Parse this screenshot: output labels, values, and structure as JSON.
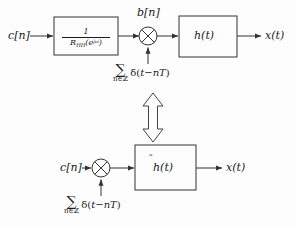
{
  "figure": {
    "background_color": "#fdfdfd",
    "line_color": "#333333",
    "text_color": "#1a1a1a"
  },
  "top_diagram": {
    "input_label": "c[n]",
    "prefilter_block": {
      "numerator": "1",
      "denominator_base": "R",
      "denominator_sub": "HH",
      "denominator_arg_open": "(e",
      "denominator_arg_sup": "jω",
      "denominator_arg_close": ")"
    },
    "intermediate_label": "b[n]",
    "multiplier_symbol": "×",
    "impulse_train": {
      "operator": "∑",
      "limit": "n∈ℤ",
      "body_open": "δ(",
      "body": "t−nT",
      "body_close": ")"
    },
    "filter_block_label": "h(t)",
    "output_label": "x(t)"
  },
  "equivalence_arrow": {
    "name": "double-headed-vertical-arrow",
    "direction": "up-down"
  },
  "bottom_diagram": {
    "input_label": "c[n]",
    "multiplier_symbol": "×",
    "impulse_train": {
      "operator": "∑",
      "limit": "n∈ℤ",
      "body_open": "δ(",
      "body": "t−nT",
      "body_close": ")"
    },
    "filter_block_label_base": "h",
    "filter_block_label_tilde": "̃",
    "filter_block_label_arg": "(t)",
    "output_label": "x(t)"
  }
}
